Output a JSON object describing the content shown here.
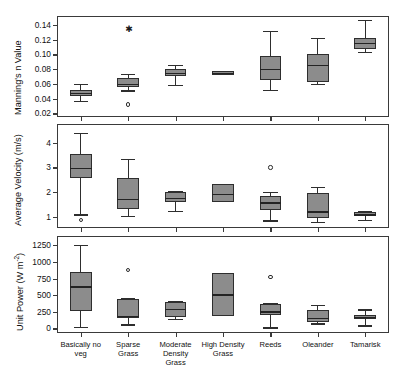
{
  "figure": {
    "background": "#ffffff",
    "box_fill": "#8c8c8c",
    "line_color": "#2e2e2e"
  },
  "categories": [
    "Basically no\nveg",
    "Sparse\nGrass",
    "Moderate\nDensity\nGrass",
    "High Density\nGrass",
    "Reeds",
    "Oleander",
    "Tamarisk"
  ],
  "category_lines": [
    [
      "Basically no",
      "veg"
    ],
    [
      "Sparse",
      "Grass"
    ],
    [
      "Moderate",
      "Density",
      "Grass"
    ],
    [
      "High Density",
      "Grass"
    ],
    [
      "Reeds"
    ],
    [
      "Oleander"
    ],
    [
      "Tamarisk"
    ]
  ],
  "chart_data": [
    {
      "type": "box",
      "panel": 1,
      "title": "",
      "xlabel": "",
      "ylabel": "Manning's n Value",
      "ylim": [
        0.015,
        0.152
      ],
      "yticks": [
        0.02,
        0.04,
        0.06,
        0.08,
        0.1,
        0.12,
        0.14
      ],
      "ytick_labels": [
        "0.02",
        "0.04",
        "0.06",
        "0.08",
        "0.10",
        "0.12",
        "0.14"
      ],
      "grid": false,
      "legend": "none",
      "categories": [
        "Basically no veg",
        "Sparse Grass",
        "Moderate Density Grass",
        "High Density Grass",
        "Reeds",
        "Oleander",
        "Tamarisk"
      ],
      "boxes": [
        {
          "category": "Basically no veg",
          "whisker_low": 0.037,
          "q1": 0.044,
          "median": 0.048,
          "q3": 0.052,
          "whisker_high": 0.06,
          "outliers": []
        },
        {
          "category": "Sparse Grass",
          "whisker_low": 0.051,
          "q1": 0.056,
          "median": 0.06,
          "q3": 0.068,
          "whisker_high": 0.073,
          "outliers": [
            0.032
          ],
          "extreme_outliers": [
            0.133
          ]
        },
        {
          "category": "Moderate Density Grass",
          "whisker_low": 0.058,
          "q1": 0.071,
          "median": 0.075,
          "q3": 0.08,
          "whisker_high": 0.086,
          "outliers": []
        },
        {
          "category": "High Density Grass",
          "whisker_low": 0.072,
          "q1": 0.072,
          "median": 0.075,
          "q3": 0.078,
          "whisker_high": 0.078,
          "outliers": []
        },
        {
          "category": "Reeds",
          "whisker_low": 0.052,
          "q1": 0.065,
          "median": 0.08,
          "q3": 0.098,
          "whisker_high": 0.132,
          "outliers": []
        },
        {
          "category": "Oleander",
          "whisker_low": 0.06,
          "q1": 0.062,
          "median": 0.086,
          "q3": 0.1,
          "whisker_high": 0.122,
          "outliers": []
        },
        {
          "category": "Tamarisk",
          "whisker_low": 0.103,
          "q1": 0.107,
          "median": 0.116,
          "q3": 0.122,
          "whisker_high": 0.147,
          "outliers": []
        }
      ]
    },
    {
      "type": "box",
      "panel": 2,
      "title": "",
      "xlabel": "",
      "ylabel": "Average Velocity (m/s)",
      "ylim": [
        0.55,
        4.75
      ],
      "yticks": [
        1,
        2,
        3,
        4
      ],
      "ytick_labels": [
        "1",
        "2",
        "3",
        "4"
      ],
      "grid": false,
      "legend": "none",
      "categories": [
        "Basically no veg",
        "Sparse Grass",
        "Moderate Density Grass",
        "High Density Grass",
        "Reeds",
        "Oleander",
        "Tamarisk"
      ],
      "boxes": [
        {
          "category": "Basically no veg",
          "whisker_low": 1.1,
          "q1": 2.56,
          "median": 2.99,
          "q3": 3.53,
          "whisker_high": 4.38,
          "outliers": [
            0.87
          ]
        },
        {
          "category": "Sparse Grass",
          "whisker_low": 1.05,
          "q1": 1.33,
          "median": 1.73,
          "q3": 2.56,
          "whisker_high": 3.33,
          "outliers": []
        },
        {
          "category": "Moderate Density Grass",
          "whisker_low": 1.23,
          "q1": 1.6,
          "median": 1.76,
          "q3": 1.99,
          "whisker_high": 2.06,
          "outliers": []
        },
        {
          "category": "High Density Grass",
          "whisker_low": 1.6,
          "q1": 1.6,
          "median": 1.93,
          "q3": 2.34,
          "whisker_high": 2.34,
          "outliers": []
        },
        {
          "category": "Reeds",
          "whisker_low": 0.86,
          "q1": 1.28,
          "median": 1.58,
          "q3": 1.86,
          "whisker_high": 2.02,
          "outliers": [
            2.99
          ]
        },
        {
          "category": "Oleander",
          "whisker_low": 0.8,
          "q1": 0.97,
          "median": 1.22,
          "q3": 1.96,
          "whisker_high": 2.22,
          "outliers": []
        },
        {
          "category": "Tamarisk",
          "whisker_low": 0.89,
          "q1": 1.03,
          "median": 1.1,
          "q3": 1.18,
          "whisker_high": 1.25,
          "outliers": []
        }
      ]
    },
    {
      "type": "box",
      "panel": 3,
      "title": "",
      "xlabel": "",
      "ylabel": "Unit Power (W m-2)",
      "ylim": [
        -70,
        1390
      ],
      "yticks": [
        0,
        250,
        500,
        750,
        1000,
        1250
      ],
      "ytick_labels": [
        "0",
        "250",
        "500",
        "750",
        "1000",
        "1250"
      ],
      "grid": false,
      "legend": "none",
      "categories": [
        "Basically no veg",
        "Sparse Grass",
        "Moderate Density Grass",
        "High Density Grass",
        "Reeds",
        "Oleander",
        "Tamarisk"
      ],
      "boxes": [
        {
          "category": "Basically no veg",
          "whisker_low": 20,
          "q1": 265,
          "median": 635,
          "q3": 855,
          "whisker_high": 1255,
          "outliers": []
        },
        {
          "category": "Sparse Grass",
          "whisker_low": 60,
          "q1": 160,
          "median": 185,
          "q3": 440,
          "whisker_high": 455,
          "outliers": [
            875
          ]
        },
        {
          "category": "Moderate Density Grass",
          "whisker_low": 140,
          "q1": 175,
          "median": 290,
          "q3": 400,
          "whisker_high": 415,
          "outliers": []
        },
        {
          "category": "High Density Grass",
          "whisker_low": 185,
          "q1": 185,
          "median": 510,
          "q3": 830,
          "whisker_high": 830,
          "outliers": []
        },
        {
          "category": "Reeds",
          "whisker_low": 15,
          "q1": 195,
          "median": 255,
          "q3": 370,
          "whisker_high": 385,
          "outliers": [
            775
          ]
        },
        {
          "category": "Oleander",
          "whisker_low": 75,
          "q1": 100,
          "median": 160,
          "q3": 270,
          "whisker_high": 350,
          "outliers": []
        },
        {
          "category": "Tamarisk",
          "whisker_low": 45,
          "q1": 140,
          "median": 175,
          "q3": 205,
          "whisker_high": 285,
          "outliers": []
        }
      ]
    }
  ]
}
